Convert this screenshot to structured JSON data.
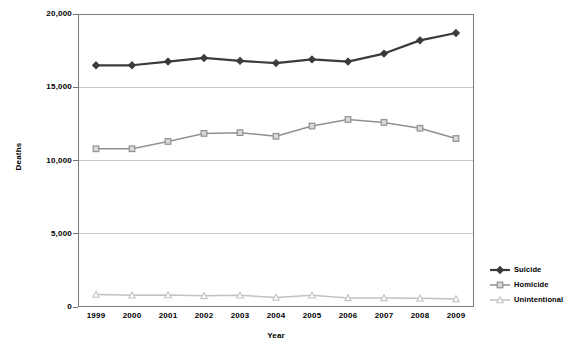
{
  "chart_data": {
    "type": "line",
    "title": "",
    "xlabel": "Year",
    "ylabel": "Deaths",
    "categories": [
      "1999",
      "2000",
      "2001",
      "2002",
      "2003",
      "2004",
      "2005",
      "2006",
      "2007",
      "2008",
      "2009"
    ],
    "ylim": [
      0,
      20000
    ],
    "yticks": [
      0,
      5000,
      10000,
      15000,
      20000
    ],
    "ytick_labels": [
      "0",
      "5,000",
      "10,000",
      "15,000",
      "20,000"
    ],
    "grid": true,
    "grid_axis": "y",
    "legend_position": "right",
    "series": [
      {
        "name": "Suicide",
        "marker": "diamond",
        "color": "#3b3b3b",
        "values": [
          16500,
          16500,
          16750,
          17000,
          16800,
          16650,
          16900,
          16750,
          17300,
          18200,
          18700
        ]
      },
      {
        "name": "Homicide",
        "marker": "square",
        "color": "#919191",
        "values": [
          10800,
          10800,
          11300,
          11850,
          11900,
          11650,
          12350,
          12800,
          12600,
          12200,
          11500
        ]
      },
      {
        "name": "Unintentional",
        "marker": "triangle",
        "color": "#c2c2c2",
        "values": [
          850,
          800,
          820,
          760,
          800,
          650,
          800,
          620,
          620,
          600,
          550
        ]
      }
    ]
  },
  "axis": {
    "y_title": "Deaths",
    "x_title": "Year"
  },
  "legend": {
    "items": [
      {
        "label": "Suicide",
        "marker": "diamond-marker-icon"
      },
      {
        "label": "Homicide",
        "marker": "square-marker-icon"
      },
      {
        "label": "Unintentional",
        "marker": "triangle-marker-icon"
      }
    ]
  },
  "plot_area": {
    "left": 78,
    "top": 14,
    "right": 474,
    "bottom": 307
  },
  "colors": {
    "suicide": "#3b3b3b",
    "homicide": "#919191",
    "unintentional": "#c2c2c2",
    "gridline": "#c9c9c9",
    "frame": "#7a7a7a",
    "background": "#ffffff"
  }
}
